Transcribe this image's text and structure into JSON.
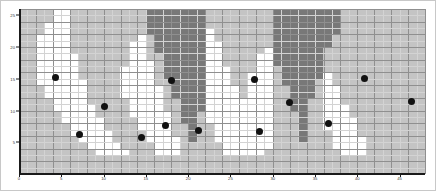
{
  "figure": {
    "background_color": "#ffffff",
    "border_color": "#c8c8c8",
    "axis_color": "#1a1a1a",
    "gridline_color": "#8f8f8f",
    "minor_gridline_color": "#d3d3d3"
  },
  "chart_data": {
    "type": "heatmap",
    "title": "",
    "subtitle": "",
    "xlabel": "",
    "ylabel": "",
    "xlim": [
      0,
      48
    ],
    "ylim": [
      0,
      26
    ],
    "grid": true,
    "legend": null,
    "legend_position": "none",
    "ncols": 48,
    "nrows": 26,
    "color_levels": [
      {
        "name": "low",
        "color": "#ffffff"
      },
      {
        "name": "mid",
        "color": "#c4c4c4"
      },
      {
        "name": "high",
        "color": "#787878"
      }
    ],
    "xticks": [
      0,
      5,
      10,
      15,
      20,
      25,
      30,
      35,
      40,
      45
    ],
    "xticklabels": [
      "0",
      "5",
      "10",
      "15",
      "20",
      "25",
      "30",
      "35",
      "40",
      "45"
    ],
    "yticks": [
      5,
      10,
      15,
      20,
      25
    ],
    "yticklabels": [
      "5",
      "10",
      "15",
      "20",
      "25"
    ],
    "matrix": [
      [
        1,
        1,
        1,
        1,
        0,
        0,
        1,
        1,
        1,
        1,
        1,
        1,
        1,
        1,
        1,
        2,
        2,
        2,
        2,
        2,
        2,
        2,
        1,
        1,
        1,
        1,
        1,
        1,
        1,
        1,
        2,
        2,
        2,
        2,
        2,
        2,
        2,
        2,
        1,
        1,
        1,
        1,
        1,
        1,
        1,
        1,
        1,
        1
      ],
      [
        1,
        1,
        1,
        1,
        0,
        0,
        1,
        1,
        1,
        1,
        1,
        1,
        1,
        1,
        1,
        2,
        2,
        2,
        2,
        2,
        2,
        2,
        1,
        1,
        1,
        1,
        1,
        1,
        1,
        1,
        2,
        2,
        2,
        2,
        2,
        2,
        2,
        2,
        1,
        1,
        1,
        1,
        1,
        1,
        1,
        1,
        1,
        1
      ],
      [
        1,
        1,
        1,
        0,
        0,
        0,
        1,
        1,
        1,
        1,
        1,
        1,
        1,
        1,
        1,
        2,
        2,
        2,
        2,
        2,
        2,
        2,
        1,
        1,
        1,
        1,
        1,
        1,
        1,
        1,
        2,
        2,
        2,
        2,
        2,
        2,
        2,
        2,
        1,
        1,
        1,
        1,
        1,
        1,
        1,
        1,
        1,
        1
      ],
      [
        1,
        1,
        1,
        0,
        0,
        0,
        1,
        1,
        1,
        1,
        1,
        1,
        1,
        1,
        1,
        2,
        2,
        2,
        2,
        2,
        2,
        2,
        0,
        1,
        1,
        1,
        1,
        1,
        1,
        1,
        2,
        2,
        2,
        2,
        2,
        2,
        2,
        2,
        1,
        1,
        1,
        1,
        1,
        1,
        1,
        1,
        1,
        1
      ],
      [
        1,
        1,
        0,
        0,
        0,
        0,
        1,
        1,
        1,
        1,
        1,
        1,
        1,
        1,
        0,
        1,
        2,
        2,
        2,
        2,
        2,
        2,
        0,
        1,
        1,
        1,
        1,
        1,
        1,
        1,
        2,
        2,
        2,
        2,
        2,
        2,
        2,
        1,
        1,
        1,
        1,
        1,
        1,
        1,
        1,
        1,
        1,
        1
      ],
      [
        1,
        1,
        0,
        0,
        0,
        0,
        1,
        1,
        1,
        1,
        1,
        1,
        1,
        0,
        0,
        1,
        2,
        2,
        2,
        2,
        2,
        2,
        0,
        0,
        1,
        1,
        1,
        1,
        1,
        1,
        2,
        2,
        2,
        2,
        2,
        2,
        2,
        1,
        1,
        1,
        1,
        1,
        1,
        1,
        1,
        1,
        1,
        1
      ],
      [
        1,
        1,
        0,
        0,
        0,
        0,
        1,
        1,
        1,
        1,
        1,
        1,
        1,
        0,
        0,
        1,
        2,
        2,
        2,
        2,
        2,
        2,
        0,
        0,
        1,
        1,
        1,
        1,
        1,
        0,
        2,
        2,
        2,
        2,
        2,
        2,
        1,
        1,
        1,
        1,
        1,
        1,
        1,
        1,
        1,
        1,
        1,
        1
      ],
      [
        1,
        1,
        0,
        0,
        0,
        0,
        0,
        1,
        1,
        1,
        1,
        1,
        1,
        0,
        0,
        1,
        1,
        2,
        2,
        2,
        2,
        2,
        0,
        0,
        1,
        1,
        1,
        1,
        0,
        0,
        2,
        2,
        2,
        2,
        2,
        2,
        1,
        1,
        1,
        1,
        1,
        1,
        1,
        1,
        1,
        1,
        1,
        1
      ],
      [
        1,
        1,
        0,
        0,
        0,
        0,
        0,
        1,
        1,
        1,
        1,
        1,
        1,
        0,
        0,
        0,
        1,
        2,
        2,
        2,
        2,
        2,
        0,
        0,
        1,
        1,
        1,
        1,
        0,
        0,
        2,
        2,
        2,
        2,
        2,
        2,
        1,
        1,
        1,
        1,
        1,
        1,
        1,
        1,
        1,
        1,
        1,
        1
      ],
      [
        1,
        1,
        0,
        0,
        0,
        0,
        0,
        1,
        1,
        1,
        1,
        1,
        0,
        0,
        0,
        0,
        1,
        2,
        2,
        2,
        2,
        2,
        0,
        0,
        0,
        1,
        1,
        1,
        0,
        0,
        1,
        2,
        2,
        2,
        2,
        2,
        1,
        1,
        1,
        1,
        1,
        1,
        1,
        1,
        1,
        1,
        1,
        1
      ],
      [
        1,
        1,
        0,
        0,
        0,
        0,
        0,
        1,
        1,
        1,
        1,
        1,
        0,
        0,
        0,
        0,
        1,
        2,
        2,
        2,
        2,
        2,
        0,
        0,
        0,
        1,
        1,
        0,
        0,
        0,
        1,
        2,
        2,
        2,
        2,
        2,
        0,
        1,
        1,
        1,
        1,
        1,
        1,
        1,
        1,
        1,
        1,
        1
      ],
      [
        1,
        1,
        0,
        0,
        0,
        0,
        0,
        0,
        1,
        1,
        1,
        1,
        0,
        0,
        0,
        0,
        1,
        1,
        2,
        2,
        2,
        2,
        0,
        0,
        0,
        1,
        1,
        0,
        0,
        0,
        1,
        2,
        2,
        2,
        2,
        1,
        0,
        1,
        1,
        1,
        1,
        1,
        1,
        1,
        1,
        1,
        1,
        1
      ],
      [
        1,
        1,
        1,
        0,
        0,
        0,
        0,
        0,
        1,
        1,
        1,
        1,
        0,
        0,
        0,
        0,
        0,
        1,
        2,
        2,
        2,
        2,
        0,
        0,
        0,
        0,
        1,
        0,
        0,
        0,
        1,
        1,
        2,
        2,
        2,
        1,
        0,
        0,
        1,
        1,
        1,
        1,
        1,
        1,
        1,
        1,
        1,
        1
      ],
      [
        1,
        1,
        1,
        0,
        0,
        0,
        0,
        0,
        1,
        1,
        1,
        1,
        0,
        0,
        0,
        0,
        0,
        1,
        2,
        2,
        2,
        2,
        0,
        0,
        0,
        0,
        1,
        0,
        0,
        0,
        1,
        1,
        2,
        2,
        2,
        1,
        0,
        0,
        1,
        1,
        1,
        1,
        1,
        1,
        1,
        1,
        1,
        1
      ],
      [
        1,
        1,
        1,
        1,
        0,
        0,
        0,
        0,
        1,
        1,
        1,
        1,
        1,
        0,
        0,
        0,
        0,
        1,
        1,
        2,
        2,
        2,
        0,
        0,
        0,
        0,
        0,
        0,
        0,
        0,
        1,
        1,
        2,
        2,
        1,
        1,
        0,
        0,
        1,
        1,
        1,
        1,
        1,
        1,
        1,
        1,
        1,
        1
      ],
      [
        1,
        1,
        1,
        1,
        0,
        0,
        0,
        0,
        0,
        1,
        1,
        1,
        1,
        0,
        0,
        0,
        0,
        1,
        1,
        2,
        2,
        2,
        0,
        0,
        0,
        0,
        0,
        0,
        0,
        0,
        1,
        1,
        2,
        2,
        1,
        1,
        0,
        0,
        0,
        1,
        1,
        1,
        1,
        1,
        1,
        1,
        1,
        1
      ],
      [
        1,
        1,
        1,
        1,
        1,
        0,
        0,
        0,
        0,
        1,
        1,
        1,
        1,
        0,
        0,
        0,
        0,
        0,
        1,
        2,
        2,
        1,
        0,
        0,
        0,
        0,
        0,
        0,
        0,
        0,
        1,
        1,
        1,
        2,
        1,
        1,
        0,
        0,
        0,
        1,
        1,
        1,
        1,
        1,
        1,
        1,
        1,
        1
      ],
      [
        1,
        1,
        1,
        1,
        1,
        0,
        0,
        0,
        0,
        0,
        1,
        1,
        1,
        1,
        0,
        0,
        0,
        0,
        1,
        2,
        2,
        1,
        0,
        0,
        0,
        0,
        0,
        0,
        0,
        0,
        1,
        1,
        1,
        2,
        1,
        1,
        0,
        0,
        0,
        0,
        1,
        1,
        1,
        1,
        1,
        1,
        1,
        1
      ],
      [
        1,
        1,
        1,
        1,
        1,
        1,
        0,
        0,
        0,
        0,
        1,
        1,
        1,
        1,
        0,
        0,
        0,
        0,
        1,
        1,
        2,
        1,
        1,
        0,
        0,
        0,
        0,
        0,
        0,
        0,
        1,
        1,
        1,
        2,
        1,
        1,
        0,
        0,
        0,
        0,
        1,
        1,
        1,
        1,
        1,
        1,
        1,
        1
      ],
      [
        1,
        1,
        1,
        1,
        1,
        1,
        0,
        0,
        0,
        0,
        0,
        1,
        1,
        1,
        1,
        0,
        0,
        0,
        1,
        1,
        2,
        1,
        1,
        0,
        0,
        0,
        0,
        0,
        0,
        0,
        1,
        1,
        1,
        2,
        1,
        1,
        1,
        0,
        0,
        0,
        1,
        1,
        1,
        1,
        1,
        1,
        1,
        1
      ],
      [
        1,
        1,
        1,
        1,
        1,
        1,
        1,
        0,
        0,
        0,
        0,
        1,
        1,
        1,
        1,
        0,
        0,
        0,
        0,
        1,
        2,
        1,
        1,
        0,
        0,
        0,
        0,
        0,
        0,
        0,
        1,
        1,
        1,
        2,
        1,
        1,
        1,
        0,
        0,
        0,
        0,
        1,
        1,
        1,
        1,
        1,
        1,
        1
      ],
      [
        1,
        1,
        1,
        1,
        1,
        1,
        1,
        1,
        0,
        0,
        0,
        0,
        1,
        1,
        1,
        1,
        0,
        0,
        0,
        1,
        1,
        1,
        1,
        1,
        0,
        0,
        0,
        0,
        0,
        0,
        1,
        1,
        1,
        1,
        1,
        1,
        1,
        0,
        0,
        0,
        0,
        1,
        1,
        1,
        1,
        1,
        1,
        1
      ],
      [
        1,
        1,
        1,
        1,
        1,
        1,
        1,
        1,
        1,
        0,
        0,
        0,
        0,
        1,
        1,
        1,
        0,
        0,
        0,
        1,
        1,
        1,
        1,
        1,
        0,
        0,
        0,
        0,
        0,
        1,
        1,
        1,
        1,
        1,
        1,
        1,
        1,
        1,
        0,
        0,
        0,
        1,
        1,
        1,
        1,
        1,
        1,
        1
      ],
      [
        1,
        1,
        1,
        1,
        1,
        1,
        1,
        1,
        1,
        1,
        1,
        1,
        1,
        1,
        1,
        1,
        1,
        1,
        1,
        1,
        1,
        1,
        1,
        1,
        1,
        1,
        1,
        1,
        1,
        1,
        1,
        1,
        1,
        1,
        1,
        1,
        1,
        1,
        1,
        1,
        1,
        1,
        1,
        1,
        1,
        1,
        1,
        1
      ],
      [
        1,
        1,
        1,
        1,
        1,
        1,
        1,
        1,
        1,
        1,
        1,
        1,
        1,
        1,
        1,
        1,
        1,
        1,
        1,
        1,
        1,
        1,
        1,
        1,
        1,
        1,
        1,
        1,
        1,
        1,
        1,
        1,
        1,
        1,
        1,
        1,
        1,
        1,
        1,
        1,
        1,
        1,
        1,
        1,
        1,
        1,
        1,
        1
      ],
      [
        1,
        1,
        1,
        1,
        1,
        1,
        1,
        1,
        1,
        1,
        1,
        1,
        1,
        1,
        1,
        1,
        1,
        1,
        1,
        1,
        1,
        1,
        1,
        1,
        1,
        1,
        1,
        1,
        1,
        1,
        1,
        1,
        1,
        1,
        1,
        1,
        1,
        1,
        1,
        1,
        1,
        1,
        1,
        1,
        1,
        1,
        1,
        1
      ]
    ],
    "scatter": {
      "name": "observations",
      "marker": "filled-circle",
      "color": "#111111",
      "points": [
        {
          "x": 4.3,
          "y": 15.2
        },
        {
          "x": 10.1,
          "y": 10.6
        },
        {
          "x": 7.1,
          "y": 6.3
        },
        {
          "x": 14.5,
          "y": 5.8
        },
        {
          "x": 18.0,
          "y": 14.8
        },
        {
          "x": 17.3,
          "y": 7.6
        },
        {
          "x": 21.2,
          "y": 6.8
        },
        {
          "x": 27.8,
          "y": 14.9
        },
        {
          "x": 28.4,
          "y": 6.7
        },
        {
          "x": 32.0,
          "y": 11.3
        },
        {
          "x": 36.6,
          "y": 8.0
        },
        {
          "x": 40.9,
          "y": 15.1
        },
        {
          "x": 46.4,
          "y": 11.5
        }
      ]
    }
  }
}
